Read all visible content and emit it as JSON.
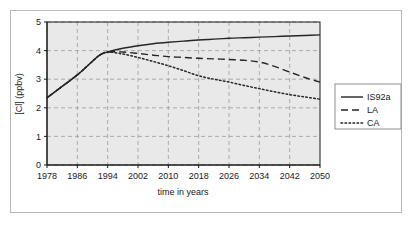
{
  "chart_data": {
    "type": "line",
    "title": "",
    "xlabel": "time in years",
    "ylabel": "[Cl] (ppbv)",
    "xlim": [
      1978,
      2050
    ],
    "ylim": [
      0,
      5
    ],
    "xticks": [
      "1978",
      "1986",
      "1994",
      "2002",
      "2010",
      "2018",
      "2026",
      "2034",
      "2042",
      "2050"
    ],
    "yticks": [
      "0",
      "1",
      "2",
      "3",
      "4",
      "5"
    ],
    "grid": true,
    "legend_position": "right-outside",
    "x": [
      1978,
      1982,
      1986,
      1990,
      1992,
      1994,
      1998,
      2002,
      2006,
      2010,
      2014,
      2018,
      2022,
      2026,
      2030,
      2034,
      2038,
      2042,
      2046,
      2050
    ],
    "series": [
      {
        "name": "IS92a",
        "style": "solid",
        "color": "#262626",
        "values": [
          2.35,
          2.75,
          3.15,
          3.63,
          3.85,
          3.95,
          4.08,
          4.17,
          4.24,
          4.29,
          4.33,
          4.37,
          4.4,
          4.43,
          4.45,
          4.47,
          4.49,
          4.51,
          4.53,
          4.55
        ]
      },
      {
        "name": "LA",
        "style": "dashed",
        "color": "#262626",
        "values": [
          2.35,
          2.75,
          3.15,
          3.63,
          3.85,
          3.95,
          3.95,
          3.9,
          3.84,
          3.79,
          3.76,
          3.73,
          3.71,
          3.69,
          3.66,
          3.6,
          3.45,
          3.25,
          3.06,
          2.9
        ]
      },
      {
        "name": "CA",
        "style": "dotted",
        "color": "#262626",
        "values": [
          2.35,
          2.75,
          3.15,
          3.63,
          3.85,
          3.95,
          3.88,
          3.76,
          3.62,
          3.47,
          3.3,
          3.12,
          3.0,
          2.9,
          2.78,
          2.67,
          2.56,
          2.46,
          2.38,
          2.3
        ]
      }
    ]
  },
  "legend": {
    "items": [
      {
        "label": "IS92a",
        "style": "solid"
      },
      {
        "label": "LA",
        "style": "dashed"
      },
      {
        "label": "CA",
        "style": "dotted"
      }
    ]
  },
  "colors": {
    "plot_background": "#e9e9e9",
    "grid": "#9a9a9a",
    "axis": "#1a1a1a",
    "frame": "#b8b8b8",
    "series": "#262626"
  }
}
